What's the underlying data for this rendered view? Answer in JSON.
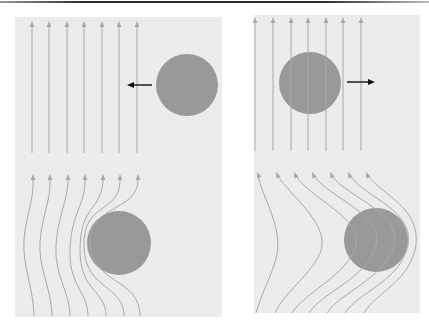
{
  "figure": {
    "colors": {
      "panel_background": "#ececec",
      "streamline": "#a9a9a9",
      "sphere": "#999999",
      "velocity_arrow": "#111111",
      "top_rule": "#2a2a2a"
    },
    "panels": [
      {
        "id": "left",
        "sphere_motion": "left",
        "top_subpanel": {
          "label": "undisturbed flow, sphere moving left",
          "streamline_count": 7
        },
        "bottom_subpanel": {
          "label": "streamlines deflected around sphere",
          "streamline_count": 7
        }
      },
      {
        "id": "right",
        "sphere_motion": "right",
        "top_subpanel": {
          "label": "undisturbed flow, sphere moving right",
          "streamline_count": 7
        },
        "bottom_subpanel": {
          "label": "streamlines curved around sphere",
          "streamline_count": 7
        }
      }
    ]
  }
}
